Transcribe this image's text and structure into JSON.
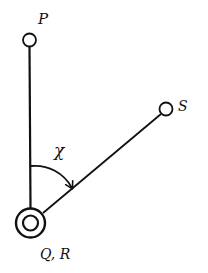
{
  "diagram": {
    "type": "angle-geometry",
    "stroke_color": "#111111",
    "background": "#ffffff",
    "points": [
      {
        "id": "P",
        "label": "P",
        "shape": "open-circle"
      },
      {
        "id": "S",
        "label": "S",
        "shape": "open-circle"
      },
      {
        "id": "QR",
        "label": "Q, R",
        "shape": "double-circle"
      }
    ],
    "segments": [
      {
        "from": "QR",
        "to": "P"
      },
      {
        "from": "QR",
        "to": "S"
      }
    ],
    "angle": {
      "label": "χ",
      "from": "QR-P",
      "to": "QR-S",
      "arrow": "clockwise"
    }
  }
}
